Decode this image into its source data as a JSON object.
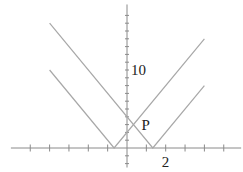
{
  "chart_data": {
    "type": "line",
    "title": "",
    "xlabel": "",
    "ylabel": "",
    "xlim": [
      -6,
      5.9
    ],
    "ylim": [
      -2.5,
      18.4
    ],
    "grid": false,
    "x_ticks": [
      -5,
      -4,
      -3,
      -2,
      -1,
      1,
      2,
      3,
      4,
      5
    ],
    "y_ticks": [
      -2,
      -1,
      1,
      2,
      3,
      4,
      5,
      6,
      7,
      8,
      9,
      10,
      11,
      12,
      13,
      14,
      15,
      16,
      17
    ],
    "tick_labels": {
      "x": [
        {
          "value": 2,
          "text": "2"
        }
      ],
      "y": [
        {
          "value": 10,
          "text": "10"
        }
      ]
    },
    "series": [
      {
        "name": "y = |3x + 2|",
        "x": [
          -4,
          -0.6667,
          4
        ],
        "y": [
          10,
          0,
          14
        ]
      },
      {
        "name": "y = |3x - 4|",
        "x": [
          -4,
          1.3333,
          4
        ],
        "y": [
          16,
          0,
          8
        ]
      }
    ],
    "annotations": [
      {
        "text": "P",
        "x": 0.3333,
        "y": 3,
        "label_offset": "right"
      }
    ]
  }
}
